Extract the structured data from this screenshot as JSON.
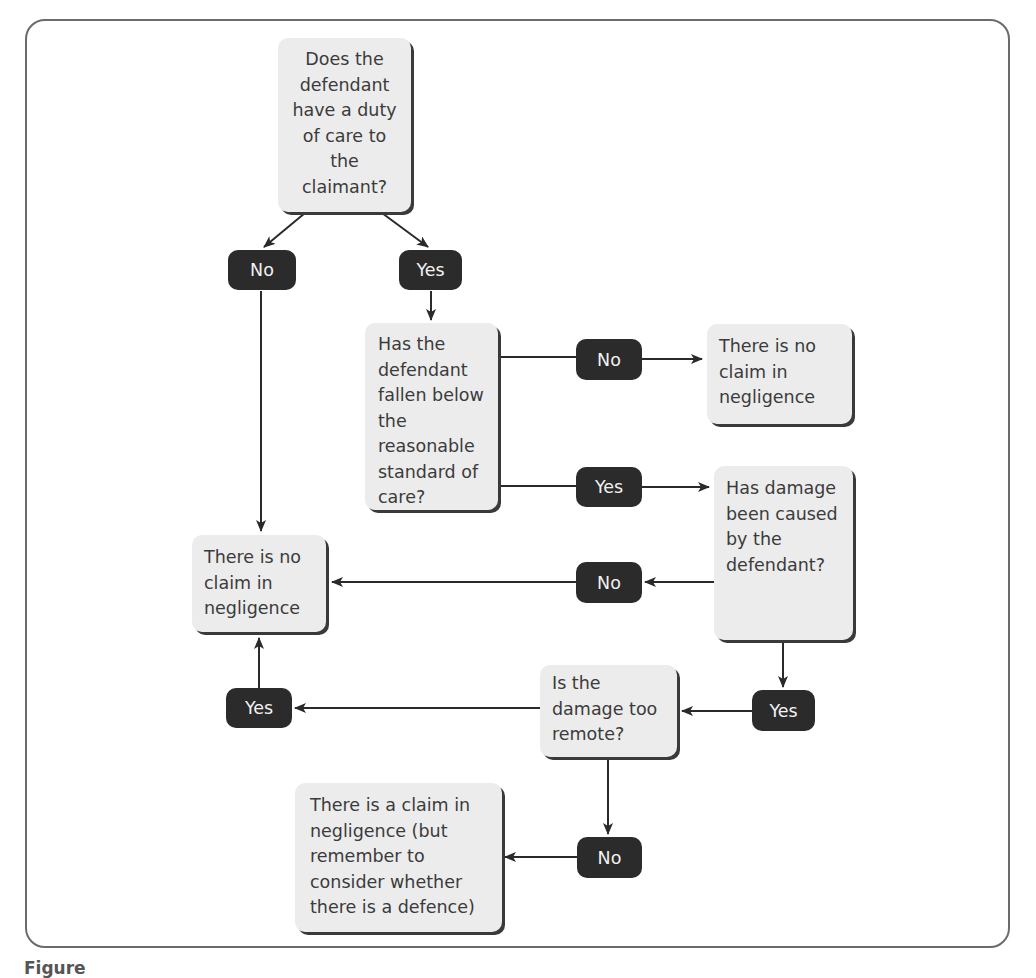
{
  "diagram": {
    "type": "flowchart",
    "questions": {
      "duty_of_care": "Does the defendant have a duty of care to the claimant?",
      "breach": "Has the defendant fallen below the reasonable standard of care?",
      "causation": "Has damage been caused by the defendant?",
      "remoteness": "Is the damage too remote?"
    },
    "outcomes": {
      "no_claim_right": "There is no claim in negligence",
      "no_claim_left": "There is no claim in negligence",
      "claim": "There is a claim in negligence (but remember to consider whether there is a defence)"
    },
    "answers": {
      "q1_no": "No",
      "q1_yes": "Yes",
      "q2_no": "No",
      "q2_yes": "Yes",
      "q3_no": "No",
      "q3_yes": "Yes",
      "q4_yes": "Yes",
      "q4_no": "No"
    },
    "edges": [
      {
        "from": "duty_of_care",
        "label": "No",
        "to": "no_claim_left"
      },
      {
        "from": "duty_of_care",
        "label": "Yes",
        "to": "breach"
      },
      {
        "from": "breach",
        "label": "No",
        "to": "no_claim_right"
      },
      {
        "from": "breach",
        "label": "Yes",
        "to": "causation"
      },
      {
        "from": "causation",
        "label": "No",
        "to": "no_claim_left"
      },
      {
        "from": "causation",
        "label": "Yes",
        "to": "remoteness"
      },
      {
        "from": "remoteness",
        "label": "Yes",
        "to": "no_claim_left"
      },
      {
        "from": "remoteness",
        "label": "No",
        "to": "claim"
      }
    ],
    "caption": "Figure"
  },
  "colors": {
    "node_fill": "#ececec",
    "answer_fill": "#2b2b2b",
    "line": "#2a2a2a",
    "frame": "#6b6b6b"
  }
}
